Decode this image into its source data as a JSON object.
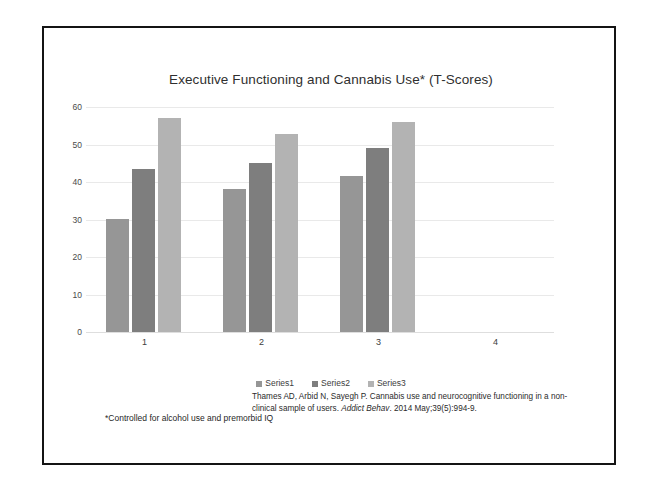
{
  "slide": {
    "title": "Executive Functioning and Cannabis Use* (T-Scores)",
    "footnote": "*Controlled for alcohol use and premorbid IQ",
    "citation": {
      "line1": "Thames AD, Arbid N, Sayegh P. Cannabis use and neurocognitive functioning in a",
      "line2_prefix": "non-clinical sample of users. ",
      "journal": "Addict Behav",
      "line2_suffix": ". 2014 May;39(5):994-9."
    },
    "frame_color": "#141414"
  },
  "chart_data": {
    "type": "bar",
    "title": "Executive Functioning and Cannabis Use* (T-Scores)",
    "xlabel": "",
    "ylabel": "",
    "categories": [
      "1",
      "2",
      "3",
      "4"
    ],
    "ylim": [
      0,
      60
    ],
    "yticks": [
      0,
      10,
      20,
      30,
      40,
      50,
      60
    ],
    "grid": true,
    "legend_position": "bottom",
    "series": [
      {
        "name": "Series1",
        "color": "#969696",
        "values": [
          30.2,
          38.2,
          41.5,
          null
        ]
      },
      {
        "name": "Series2",
        "color": "#7e7e7e",
        "values": [
          43.4,
          45.2,
          49.0,
          null
        ]
      },
      {
        "name": "Series3",
        "color": "#b3b3b3",
        "values": [
          57.1,
          52.7,
          56.1,
          null
        ]
      }
    ]
  }
}
